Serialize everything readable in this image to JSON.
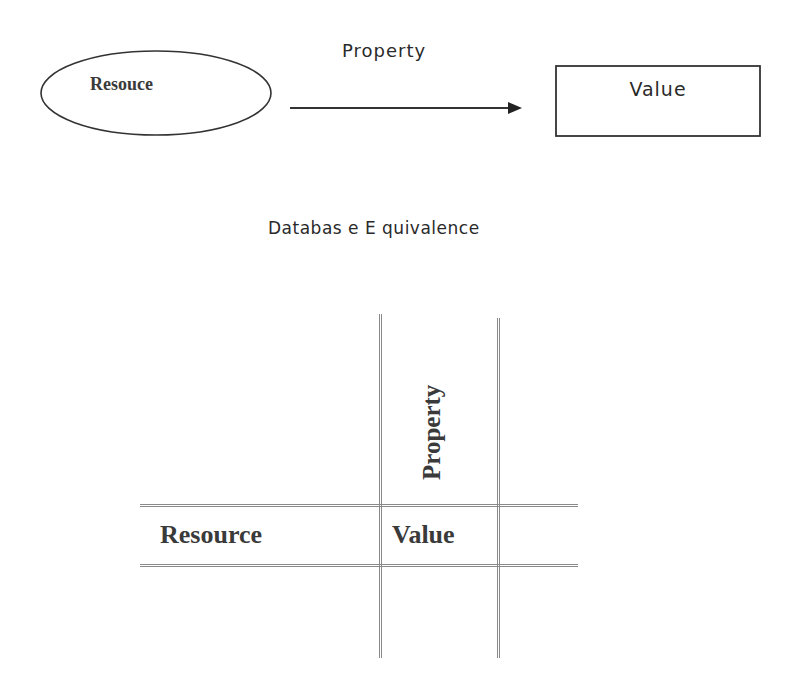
{
  "top_diagram": {
    "resource_label": "Resouce",
    "property_label": "Property",
    "value_label": "Value"
  },
  "section_title": "Databas e E quivalence",
  "table_diagram": {
    "column_header": "Property",
    "row_header": "Resource",
    "cell_value": "Value"
  }
}
